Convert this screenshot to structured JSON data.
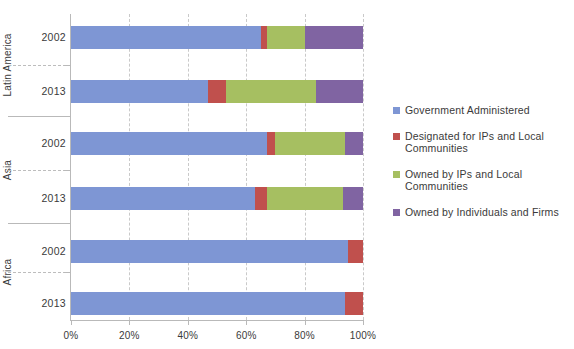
{
  "chart_data": {
    "type": "bar",
    "orientation": "horizontal",
    "stacked": true,
    "normalized_percent": true,
    "title": "",
    "xlabel": "",
    "ylabel": "",
    "xlim": [
      0,
      100
    ],
    "xticks": [
      0,
      20,
      40,
      60,
      80,
      100
    ],
    "xtick_labels": [
      "0%",
      "20%",
      "40%",
      "60%",
      "80%",
      "100%"
    ],
    "grid": true,
    "legend_position": "right",
    "groups": [
      {
        "name": "Latin America",
        "categories": [
          "2002",
          "2013"
        ]
      },
      {
        "name": "Asia",
        "categories": [
          "2002",
          "2013"
        ]
      },
      {
        "name": "Africa",
        "categories": [
          "2002",
          "2013"
        ]
      }
    ],
    "categories": [
      "Latin America 2002",
      "Latin America 2013",
      "Asia 2002",
      "Asia 2013",
      "Africa 2002",
      "Africa 2013"
    ],
    "series": [
      {
        "name": "Government Administered",
        "color": "#7e96d4",
        "values": [
          65,
          47,
          67,
          63,
          95,
          94
        ]
      },
      {
        "name": "Designated for IPs and Local Communities",
        "color": "#c0504d",
        "values": [
          2,
          6,
          3,
          4,
          5,
          6
        ]
      },
      {
        "name": "Owned by IPs and Local Communities",
        "color": "#a6bf61",
        "values": [
          13,
          31,
          24,
          26,
          0,
          0
        ]
      },
      {
        "name": "Owned by Individuals and Firms",
        "color": "#8064a2",
        "values": [
          20,
          16,
          6,
          7,
          0,
          0
        ]
      }
    ]
  },
  "legend": {
    "items": [
      {
        "label": "Government Administered",
        "color": "#7e96d4"
      },
      {
        "label": "Designated for IPs and Local Communities",
        "color": "#c0504d"
      },
      {
        "label": "Owned by IPs and Local Communities",
        "color": "#a6bf61"
      },
      {
        "label": "Owned by Individuals and Firms",
        "color": "#8064a2"
      }
    ]
  },
  "axis": {
    "x_tick_labels": [
      "0%",
      "20%",
      "40%",
      "60%",
      "80%",
      "100%"
    ]
  }
}
